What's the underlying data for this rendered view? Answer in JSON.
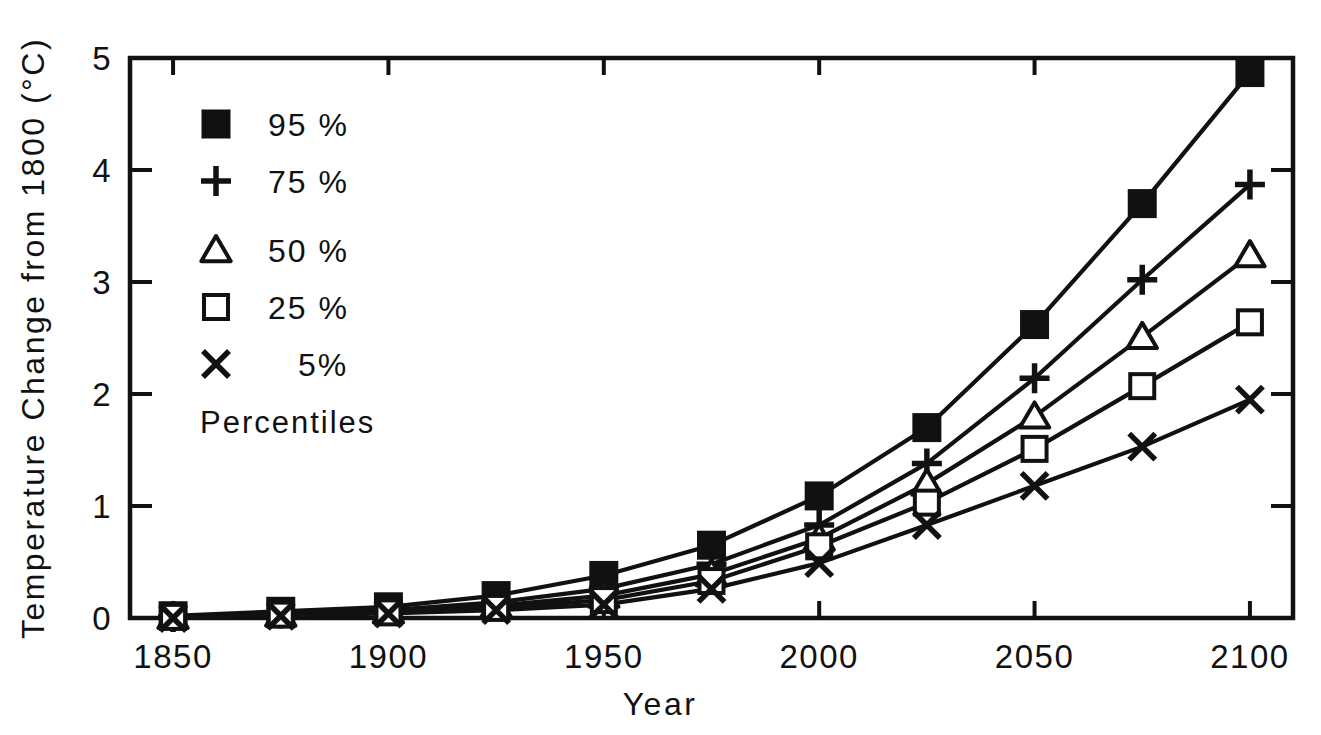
{
  "chart_data": {
    "type": "line",
    "title": "",
    "xlabel": "Year",
    "ylabel": "Temperature Change from 1800 (°C)",
    "xlim": [
      1840,
      2110
    ],
    "ylim": [
      0,
      5
    ],
    "xticks": [
      1850,
      1900,
      1950,
      2000,
      2050,
      2100
    ],
    "xtick_labels": [
      "1850",
      "1900",
      "1950",
      "2000",
      "2050",
      "2100"
    ],
    "yticks": [
      0,
      1,
      2,
      3,
      4,
      5
    ],
    "ytick_labels": [
      "0",
      "1",
      "2",
      "3",
      "4",
      "5"
    ],
    "grid": false,
    "legend_position": "upper-left",
    "legend_caption": "Percentiles",
    "x": [
      1850,
      1875,
      1900,
      1925,
      1950,
      1975,
      2000,
      2025,
      2050,
      2075,
      2100
    ],
    "series": [
      {
        "name": "95 %",
        "marker": "filled-square",
        "values": [
          0.02,
          0.06,
          0.1,
          0.2,
          0.38,
          0.65,
          1.09,
          1.7,
          2.62,
          3.7,
          4.87
        ]
      },
      {
        "name": "75 %",
        "marker": "plus",
        "values": [
          0.01,
          0.04,
          0.07,
          0.14,
          0.26,
          0.48,
          0.83,
          1.38,
          2.14,
          3.02,
          3.87
        ]
      },
      {
        "name": "50 %",
        "marker": "open-triangle",
        "values": [
          0.01,
          0.03,
          0.06,
          0.11,
          0.2,
          0.39,
          0.71,
          1.2,
          1.8,
          2.51,
          3.24
        ]
      },
      {
        "name": "25 %",
        "marker": "open-square",
        "values": [
          0.01,
          0.03,
          0.05,
          0.09,
          0.16,
          0.33,
          0.64,
          1.03,
          1.51,
          2.07,
          2.64
        ]
      },
      {
        "name": "5 %",
        "marker": "cross",
        "values": [
          0.0,
          0.02,
          0.04,
          0.07,
          0.12,
          0.26,
          0.49,
          0.83,
          1.18,
          1.53,
          1.95
        ]
      }
    ]
  },
  "legend": {
    "items": [
      {
        "marker": "filled-square",
        "label": "95 %"
      },
      {
        "marker": "plus",
        "label": "75 %"
      },
      {
        "marker": "open-triangle",
        "label": "50 %"
      },
      {
        "marker": "open-square",
        "label": "25 %"
      },
      {
        "marker": "cross",
        "label": "5%"
      }
    ],
    "caption": "Percentiles"
  },
  "colors": {
    "ink": "#111111",
    "background": "#ffffff"
  }
}
